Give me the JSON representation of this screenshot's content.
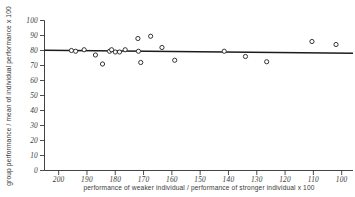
{
  "chart_data": {
    "type": "scatter",
    "title": "",
    "xlabel": "performance of weaker individual / performance of stronger individual x 100",
    "ylabel": "group performance / mean of individual performance x 100",
    "xlim": [
      205,
      96
    ],
    "ylim": [
      0,
      100
    ],
    "x_reversed": true,
    "grid": false,
    "legend": "none",
    "xticks": [
      200,
      190,
      180,
      170,
      160,
      150,
      140,
      130,
      120,
      110,
      100
    ],
    "xtick_labels": [
      "200",
      "190",
      "180",
      "170",
      "160",
      "150",
      "140",
      "130",
      "120",
      "110",
      "100"
    ],
    "yticks": [
      0,
      10,
      20,
      30,
      40,
      50,
      60,
      70,
      80,
      90,
      100
    ],
    "ytick_labels": [
      "0",
      "10",
      "20",
      "30",
      "40",
      "50",
      "60",
      "70",
      "80",
      "90",
      "100"
    ],
    "marker": "open-circle",
    "points": [
      {
        "x": 195.5,
        "y": 80.0
      },
      {
        "x": 194.0,
        "y": 79.5
      },
      {
        "x": 191.0,
        "y": 80.5
      },
      {
        "x": 187.0,
        "y": 77.0
      },
      {
        "x": 184.5,
        "y": 71.0
      },
      {
        "x": 182.0,
        "y": 79.5
      },
      {
        "x": 181.3,
        "y": 80.5
      },
      {
        "x": 180.0,
        "y": 79.0
      },
      {
        "x": 178.5,
        "y": 79.0
      },
      {
        "x": 176.5,
        "y": 80.5
      },
      {
        "x": 172.0,
        "y": 88.0
      },
      {
        "x": 171.8,
        "y": 79.5
      },
      {
        "x": 171.0,
        "y": 72.0
      },
      {
        "x": 167.5,
        "y": 89.5
      },
      {
        "x": 163.5,
        "y": 82.0
      },
      {
        "x": 159.0,
        "y": 73.5
      },
      {
        "x": 141.5,
        "y": 79.5
      },
      {
        "x": 134.0,
        "y": 76.0
      },
      {
        "x": 126.5,
        "y": 72.5
      },
      {
        "x": 110.5,
        "y": 86.0
      },
      {
        "x": 102.0,
        "y": 84.0
      }
    ],
    "trend_line": {
      "type": "linear-fit",
      "x_start": 205,
      "y_start": 80.2,
      "x_end": 96,
      "y_end": 78.2
    }
  }
}
